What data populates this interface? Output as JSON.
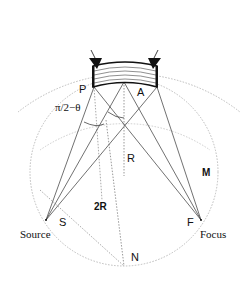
{
  "diagram": {
    "labels": {
      "P": "P",
      "A": "A",
      "angle": "π/2−θ",
      "R": "R",
      "M": "M",
      "twoR": "2R",
      "S": "S",
      "source": "Source",
      "F": "F",
      "focus": "Focus",
      "N": "N"
    },
    "points": {
      "P": [
        94,
        87
      ],
      "A": [
        124,
        82
      ],
      "Aedge": [
        157,
        87
      ],
      "S": [
        46,
        220
      ],
      "F": [
        201,
        220
      ],
      "N": [
        124,
        266
      ],
      "center": [
        124,
        165
      ]
    },
    "colors": {
      "line": "#333333",
      "dotted": "#bbbbbb",
      "crystal": "#111111"
    }
  }
}
